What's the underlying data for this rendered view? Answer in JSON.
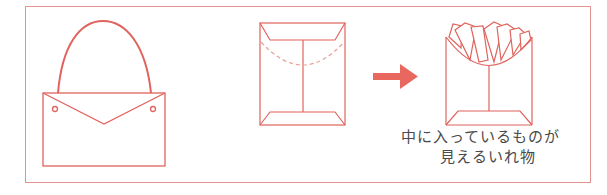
{
  "figure": {
    "colors": {
      "stroke": "#e0635d",
      "frame": "#e3928f",
      "arrow": "#e8675e",
      "dash": "#e9a09a",
      "text": "#4a4a4a"
    },
    "panels": [
      {
        "name": "handbag",
        "description": "Bag with a flap and handle"
      },
      {
        "name": "envelope",
        "description": "Envelope-shaped paper holder with dashed curved cut line"
      },
      {
        "name": "fries-holder",
        "description": "Holder with cut top showing the contents (fries)"
      }
    ],
    "arrow": {
      "direction": "right"
    },
    "caption": {
      "line1": "中に入っているものが",
      "line2": "見えるいれ物"
    }
  }
}
